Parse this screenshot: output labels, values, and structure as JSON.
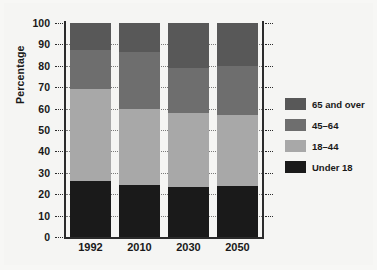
{
  "chart_data": {
    "type": "bar",
    "stacked": true,
    "title": "",
    "xlabel": "",
    "ylabel": "Percentage",
    "ylim": [
      0,
      100
    ],
    "ytick_labels": [
      "100",
      "90",
      "80",
      "70",
      "60",
      "50",
      "40",
      "30",
      "20",
      "10",
      "0"
    ],
    "ytick_values": [
      100,
      90,
      80,
      70,
      60,
      50,
      40,
      30,
      20,
      10,
      0
    ],
    "grid": true,
    "legend_position": "right",
    "categories": [
      "1992",
      "2010",
      "2030",
      "2050"
    ],
    "series": [
      {
        "name": "Under 18",
        "color": "#1a1a1a",
        "values": [
          26,
          24.5,
          23.5,
          24
        ]
      },
      {
        "name": "18–44",
        "color": "#a8a8a8",
        "values": [
          43,
          35.5,
          34.5,
          33
        ]
      },
      {
        "name": "45–64",
        "color": "#6e6e6e",
        "values": [
          18.5,
          26.5,
          21,
          23
        ]
      },
      {
        "name": "65 and over",
        "color": "#585858",
        "values": [
          12.5,
          13.5,
          21,
          20
        ]
      }
    ],
    "legend_entries": [
      {
        "label": "65 and over",
        "color": "#585858"
      },
      {
        "label": "45–64",
        "color": "#6e6e6e"
      },
      {
        "label": "18–44",
        "color": "#a8a8a8"
      },
      {
        "label": "Under 18",
        "color": "#1a1a1a"
      }
    ]
  }
}
